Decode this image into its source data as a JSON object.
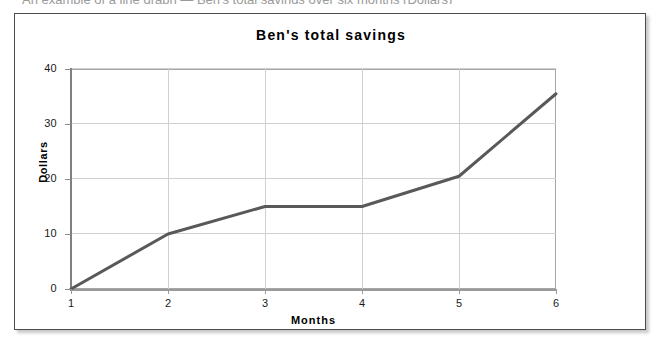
{
  "host_document": {
    "cropped_top_line": "An example of a line graph — Ben's total savings over six months (Dollars)"
  },
  "figure": {
    "title": "Ben's total savings",
    "frame": {
      "border_color": "#4c4c4c",
      "background": "#ffffff"
    }
  },
  "axes": {
    "y_title": "Dollars",
    "x_title": "Months",
    "y_ticks": [
      "40",
      "30",
      "20",
      "10",
      "0"
    ],
    "x_ticks": [
      "1",
      "2",
      "3",
      "4",
      "5",
      "6"
    ]
  },
  "colors": {
    "series_line": "#595959",
    "gridline": "#d0d0d0",
    "axis": "#999999",
    "plot_border": "#a6a6a6",
    "text": "#000000"
  },
  "chart_data": {
    "type": "line",
    "title": "Ben's total savings",
    "xlabel": "Months",
    "ylabel": "Dollars",
    "x": [
      1,
      2,
      3,
      4,
      5,
      6
    ],
    "xlim": [
      1,
      6
    ],
    "ylim": [
      0,
      40
    ],
    "ytick_values": [
      0,
      10,
      20,
      30,
      40
    ],
    "xtick_values": [
      1,
      2,
      3,
      4,
      5,
      6
    ],
    "grid": true,
    "legend": "none",
    "markers": "none",
    "series": [
      {
        "name": "Ben's total savings",
        "color": "#595959",
        "values": [
          0,
          10,
          15,
          15,
          20.5,
          35.5
        ]
      }
    ]
  },
  "bleed_through_text": [
    {
      "text": "example of reading values from a line graph",
      "x": 92,
      "y": 86,
      "size": 13
    },
    {
      "text": "savings grow steadily over the months",
      "x": 108,
      "y": 104,
      "size": 12
    },
    {
      "text": "how much did Ben save",
      "x": 430,
      "y": 232,
      "size": 12
    },
    {
      "text": "remember to label both axes",
      "x": 400,
      "y": 250,
      "size": 12
    }
  ]
}
